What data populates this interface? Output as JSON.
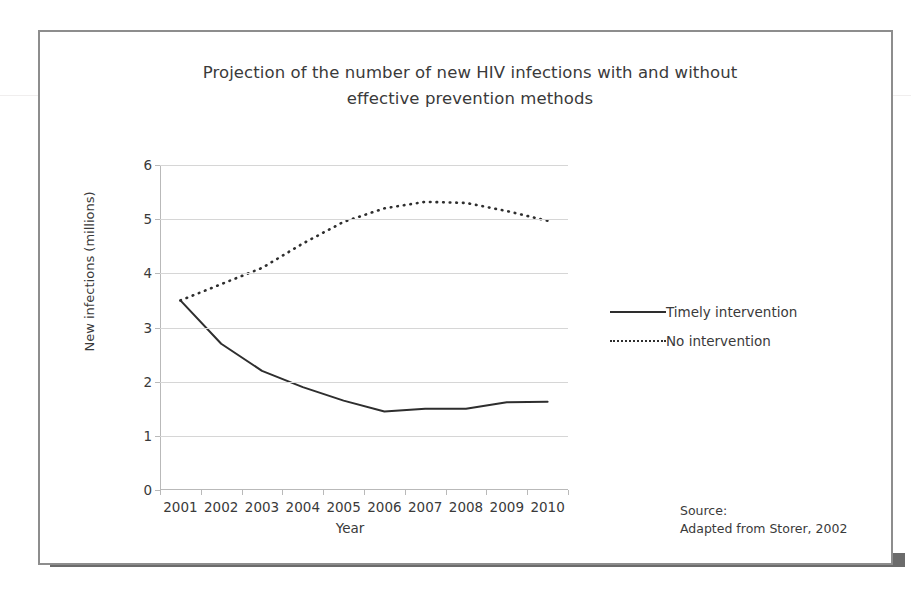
{
  "figure": {
    "title_line1": "Projection of the number of new HIV infections with and without",
    "title_line2": "effective prevention methods",
    "source_line1": "Source:",
    "source_line2": "Adapted from Storer, 2002"
  },
  "colors": {
    "frame": "#8d8d8d",
    "shadow": "#6b6b6b",
    "gridline": "#d6d6d6",
    "axis": "#b9b9b9",
    "series": "#2e2e2e",
    "text": "#3a3a3a"
  },
  "chart_data": {
    "type": "line",
    "title": "Projection of the number of new HIV infections with and without effective prevention methods",
    "xlabel": "Year",
    "ylabel": "New infections (millions)",
    "categories": [
      "2001",
      "2002",
      "2003",
      "2004",
      "2005",
      "2006",
      "2007",
      "2008",
      "2009",
      "2010"
    ],
    "x": [
      2001,
      2002,
      2003,
      2004,
      2005,
      2006,
      2007,
      2008,
      2009,
      2010
    ],
    "ylim": [
      0,
      6
    ],
    "yticks": [
      0,
      1,
      2,
      3,
      4,
      5,
      6
    ],
    "ytick_labels": [
      "0",
      "1",
      "2",
      "3",
      "4",
      "5",
      "6"
    ],
    "grid": true,
    "legend_position": "right",
    "series": [
      {
        "name": "Timely intervention",
        "style": "solid",
        "values": [
          3.5,
          2.7,
          2.2,
          1.9,
          1.65,
          1.45,
          1.5,
          1.5,
          1.62,
          1.63
        ]
      },
      {
        "name": "No intervention",
        "style": "dotted",
        "values": [
          3.5,
          3.8,
          4.1,
          4.55,
          4.95,
          5.2,
          5.32,
          5.3,
          5.15,
          4.97
        ]
      }
    ]
  }
}
